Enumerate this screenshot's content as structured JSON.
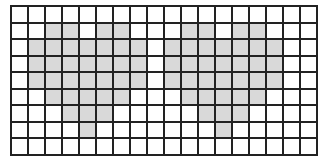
{
  "grid": {
    "columns": 18,
    "rows": 9,
    "line_color": "#222222",
    "fill_color": "#d9d9d9",
    "background_color": "#ffffff"
  },
  "shapes": [
    {
      "name": "left-heart",
      "filled_cells": {
        "1": [
          2,
          3,
          5,
          6
        ],
        "2": [
          1,
          2,
          3,
          4,
          5,
          6,
          7
        ],
        "3": [
          1,
          2,
          3,
          4,
          5,
          6,
          7
        ],
        "4": [
          1,
          2,
          3,
          4,
          5,
          6,
          7
        ],
        "5": [
          2,
          3,
          4,
          5,
          6
        ],
        "6": [
          3,
          4,
          5
        ],
        "7": [
          4
        ]
      }
    },
    {
      "name": "right-heart",
      "filled_cells": {
        "1": [
          10,
          11,
          13,
          14
        ],
        "2": [
          9,
          10,
          11,
          12,
          13,
          14,
          15
        ],
        "3": [
          9,
          10,
          11,
          12,
          13,
          14,
          15
        ],
        "4": [
          9,
          10,
          11,
          12,
          13,
          14,
          15
        ],
        "5": [
          10,
          11,
          12,
          13,
          14
        ],
        "6": [
          11,
          12,
          13
        ],
        "7": [
          12
        ]
      }
    }
  ]
}
